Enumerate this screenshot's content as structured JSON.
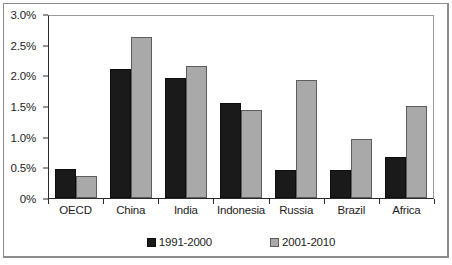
{
  "chart_data": {
    "type": "bar",
    "title": "",
    "subtitle": "",
    "xlabel": "",
    "ylabel": "",
    "ylim": [
      0,
      3.0
    ],
    "yticks": [
      0,
      0.5,
      1.0,
      1.5,
      2.0,
      2.5,
      3.0
    ],
    "ytick_labels": [
      "0%",
      "0.5%",
      "1.0%",
      "1.5%",
      "2.0%",
      "2.5%",
      "3.0%"
    ],
    "grid": false,
    "legend_position": "bottom",
    "categories": [
      "OECD",
      "China",
      "India",
      "Indonesia",
      "Russia",
      "Brazil",
      "Africa"
    ],
    "series": [
      {
        "name": "1991-2000",
        "color": "#1a1a1a",
        "values": [
          0.48,
          2.12,
          1.98,
          1.57,
          0.47,
          0.46,
          0.67
        ]
      },
      {
        "name": "2001-2010",
        "color": "#a9a9a9",
        "values": [
          0.36,
          2.65,
          2.17,
          1.45,
          1.95,
          0.97,
          1.51
        ]
      }
    ]
  }
}
